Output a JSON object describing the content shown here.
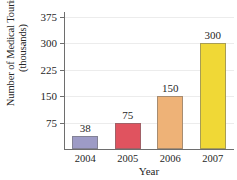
{
  "figure": {
    "title_remnant": "",
    "background": "#ffffff"
  },
  "axes": {
    "ylabel_line1": "Number of Medical Tourists",
    "ylabel_line2": "(thousands)",
    "xlabel": "Year"
  },
  "chart_data": {
    "type": "bar",
    "title": "",
    "xlabel": "Year",
    "ylabel": "Number of Medical Tourists (thousands)",
    "categories": [
      "2004",
      "2005",
      "2006",
      "2007"
    ],
    "values": [
      38,
      75,
      150,
      300
    ],
    "data_labels": [
      "38",
      "75",
      "150",
      "300"
    ],
    "bar_colors": [
      "#9d9bc6",
      "#e0535f",
      "#eeb277",
      "#f0d836"
    ],
    "ylim": [
      0,
      375
    ],
    "yticks": [
      75,
      150,
      225,
      300,
      375
    ],
    "ytick_labels": [
      "75",
      "150",
      "225",
      "300",
      "375"
    ],
    "grid": true,
    "grid_axis": "y",
    "legend": false
  }
}
